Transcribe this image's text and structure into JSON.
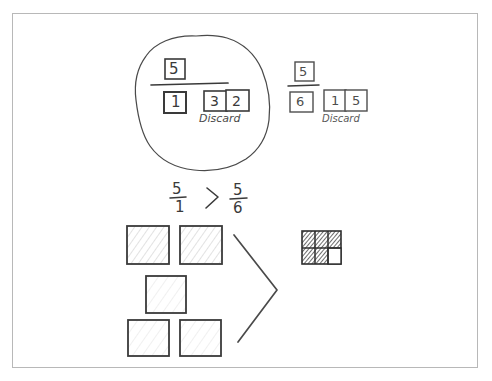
{
  "canvas": {
    "kind": "hand-drawn-whiteboard",
    "background_color": "#ffffff",
    "ink_color": "#3a3a3a",
    "border_color": "#b8b8b8",
    "width": 492,
    "height": 381
  },
  "left_group": {
    "name": "circled-fraction-five-over-one",
    "enclosure_shape": "hand-drawn-blob",
    "numerator_tile": "5",
    "denominator_tile": "1",
    "discard_tiles": [
      "3",
      "2"
    ],
    "discard_label": "Discard"
  },
  "right_group": {
    "name": "fraction-five-over-six",
    "numerator_tile": "5",
    "denominator_tile": "6",
    "discard_tiles": [
      "1",
      "5"
    ],
    "discard_label": "Discard"
  },
  "comparison": {
    "left_numerator": "5",
    "left_denominator": "1",
    "operator": ">",
    "right_numerator": "5",
    "right_denominator": "6"
  },
  "models": {
    "left_model": {
      "name": "five-wholes-area-model",
      "whole_count": 5,
      "shaded_count": 5,
      "rows": [
        2,
        1,
        2
      ],
      "shading": "light-pencil"
    },
    "big_operator": ">",
    "right_model": {
      "name": "five-sixths-area-model",
      "columns": 3,
      "rows": 2,
      "total_parts": 6,
      "shaded_parts": 5,
      "unshaded_parts": 1,
      "shading": "dark-pencil"
    }
  }
}
